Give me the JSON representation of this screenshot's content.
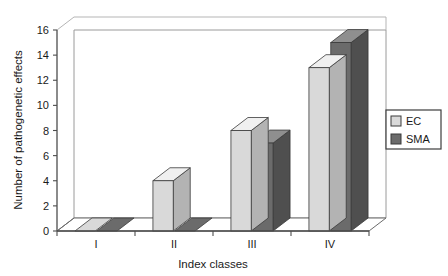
{
  "chart_data": {
    "type": "bar",
    "style": "3d-clustered-column",
    "title": "",
    "xlabel": "Index classes",
    "ylabel": "Number of pathogenetic effects",
    "categories": [
      "I",
      "II",
      "III",
      "IV"
    ],
    "series": [
      {
        "name": "EC",
        "color": "#d9d9d9",
        "values": [
          0,
          4,
          8,
          13
        ]
      },
      {
        "name": "SMA",
        "color": "#6b6b6b",
        "values": [
          0,
          0,
          7,
          15
        ]
      }
    ],
    "ylim": [
      0,
      16
    ],
    "yticks": [
      0,
      2,
      4,
      6,
      8,
      10,
      12,
      14,
      16
    ],
    "ytick_labels": [
      "0",
      "2",
      "4",
      "6",
      "8",
      "10",
      "12",
      "14",
      "16"
    ],
    "grid": false,
    "legend_position": "right",
    "legend_entries": [
      "EC",
      "SMA"
    ]
  },
  "colors": {
    "ec_front": "#d9d9d9",
    "ec_top": "#f0f0f0",
    "ec_side": "#b3b3b3",
    "sma_front": "#6b6b6b",
    "sma_top": "#8f8f8f",
    "sma_side": "#4f4f4f",
    "axis": "#4d4d4d",
    "wall": "#ffffff",
    "floor": "#ffffff",
    "text": "#1a1a1a"
  }
}
